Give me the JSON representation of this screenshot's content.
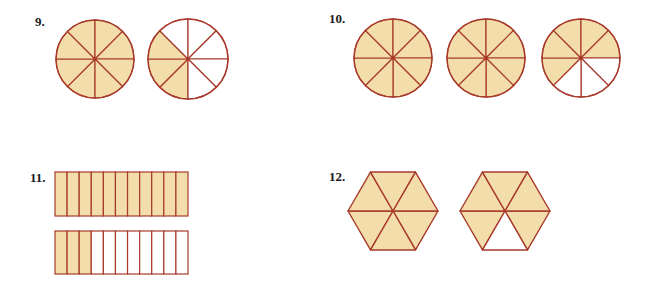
{
  "colors": {
    "fill": "#f2ddab",
    "stroke": "#a83a2c",
    "empty": "#ffffff"
  },
  "problems": [
    {
      "number": "9.",
      "shape": "circle",
      "parts": 8,
      "figures": [
        {
          "shaded": 8
        },
        {
          "shaded": 3
        }
      ]
    },
    {
      "number": "10.",
      "shape": "circle",
      "parts": 8,
      "figures": [
        {
          "shaded": 8
        },
        {
          "shaded": 8
        },
        {
          "shaded": 5
        }
      ]
    },
    {
      "number": "11.",
      "shape": "rectangle",
      "parts": 11,
      "figures": [
        {
          "shaded": 11
        },
        {
          "shaded": 3
        }
      ]
    },
    {
      "number": "12.",
      "shape": "hexagon",
      "parts": 6,
      "figures": [
        {
          "shaded": 6
        },
        {
          "shaded": 5
        }
      ]
    }
  ]
}
